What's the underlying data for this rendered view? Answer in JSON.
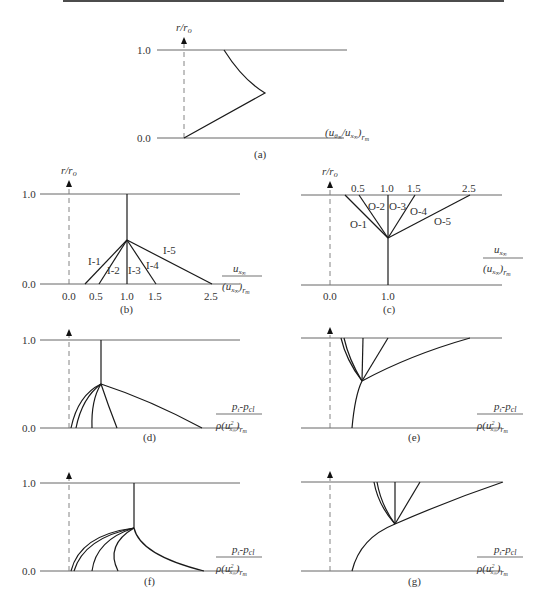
{
  "figure": {
    "panels": [
      {
        "id": "a",
        "caption": "(a)",
        "ylabel": "r/r_o",
        "xlabel": "(u_θ∞/u_x∞)_rm",
        "yticks": [
          "0.0",
          "1.0"
        ]
      },
      {
        "id": "b",
        "caption": "(b)",
        "ylabel": "r/r_o",
        "xlabel_num": "u_x∞",
        "xlabel_den": "(u_x∞)_rm",
        "yticks": [
          "0.0",
          "1.0"
        ],
        "xticks": [
          "0.0",
          "0.5",
          "1.0",
          "1.5",
          "2.5"
        ],
        "curve_labels": [
          "I-1",
          "I-2",
          "I-3",
          "I-4",
          "I-5"
        ]
      },
      {
        "id": "c",
        "caption": "(c)",
        "ylabel": "r/r_o",
        "xlabel_num": "u_x∞",
        "xlabel_den": "(u_x∞)_rm",
        "xticks": [
          "0.0",
          "1.0"
        ],
        "top_ticks": [
          "0.5",
          "1.0",
          "1.5",
          "2.5"
        ],
        "curve_labels": [
          "O-1",
          "O-2",
          "O-3",
          "O-4",
          "O-5"
        ]
      },
      {
        "id": "d",
        "caption": "(d)",
        "xlabel_num": "p_t - p_cl",
        "xlabel_den": "ρ(u²_x∞)_rm",
        "yticks": [
          "0.0",
          "1.0"
        ]
      },
      {
        "id": "e",
        "caption": "(e)",
        "xlabel_num": "p_t - p_cl",
        "xlabel_den": "ρ(u²_x∞)_rm"
      },
      {
        "id": "f",
        "caption": "(f)",
        "xlabel_num": "p_t - p_cl",
        "xlabel_den": "ρ(u²_x∞)_rm",
        "yticks": [
          "0.0",
          "1.0"
        ]
      },
      {
        "id": "g",
        "caption": "(g)",
        "xlabel_num": "p_t - p_cl",
        "xlabel_den": "ρ(u²_x∞)_rm"
      }
    ]
  },
  "text": {
    "a_cap": "(a)",
    "b_cap": "(b)",
    "c_cap": "(c)",
    "d_cap": "(d)",
    "e_cap": "(e)",
    "f_cap": "(f)",
    "g_cap": "(g)",
    "y0": "0.0",
    "y1": "1.0",
    "t00": "0.0",
    "t05": "0.5",
    "t10": "1.0",
    "t15": "1.5",
    "t25": "2.5",
    "I1": "I-1",
    "I2": "I-2",
    "I3": "I-3",
    "I4": "I-4",
    "I5": "I-5",
    "O1": "O-1",
    "O2": "O-2",
    "O3": "O-3",
    "O4": "O-4",
    "O5": "O-5",
    "r": "r",
    "ro": "r",
    "o": "o",
    "slash": "/",
    "u": "u",
    "x": "x",
    "inf": "∞",
    "rm": "r",
    "m": "m",
    "theta": "θ",
    "p": "p",
    "t": "t",
    "cl": "cl",
    "dash": "-",
    "rho": "ρ",
    "two": "2"
  }
}
